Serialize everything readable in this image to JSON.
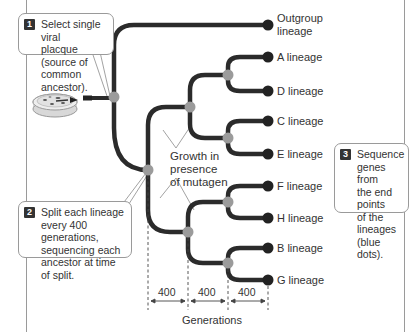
{
  "callouts": {
    "step1": {
      "number": "1",
      "text": "Select single viral\nplacque (source of\ncommon ancestor)."
    },
    "step2": {
      "number": "2",
      "text": "Split each lineage\nevery 400 generations,\nsequencing each\nancestor at time of split."
    },
    "step3": {
      "number": "3",
      "text": "Sequence\ngenes from\nthe end points\nof the lineages\n(blue dots)."
    }
  },
  "lineages": [
    {
      "id": "outgroup",
      "label": "Outgroup\nlineage"
    },
    {
      "id": "A",
      "label": "A lineage"
    },
    {
      "id": "D",
      "label": "D lineage"
    },
    {
      "id": "C",
      "label": "C lineage"
    },
    {
      "id": "E",
      "label": "E lineage"
    },
    {
      "id": "F",
      "label": "F lineage"
    },
    {
      "id": "H",
      "label": "H lineage"
    },
    {
      "id": "B",
      "label": "B lineage"
    },
    {
      "id": "G",
      "label": "G lineage"
    }
  ],
  "mutagen_label": "Growth in\npresence\nof mutagen",
  "generations": {
    "intervals": [
      "400",
      "400",
      "400"
    ],
    "title": "Generations"
  },
  "colors": {
    "branch": "#2b2b2b",
    "ancestor_node": "#9b9b9b",
    "endpoint_dot": "#222222",
    "frame": "#9a9a9a"
  }
}
